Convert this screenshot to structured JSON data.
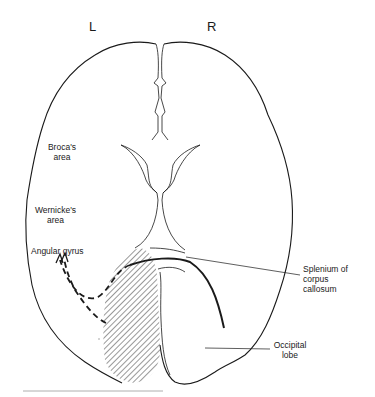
{
  "figure": {
    "type": "anatomical-diagram",
    "hemisphere_labels": {
      "left": "L",
      "right": "R"
    },
    "labels": {
      "broca": {
        "line1": "Broca's",
        "line2": "area"
      },
      "wernicke": {
        "line1": "Wernicke's",
        "line2": "area"
      },
      "angular_gyrus": "Angular gyrus",
      "splenium": {
        "line1": "Splenium of",
        "line2": "corpus",
        "line3": "callosum"
      },
      "occipital": {
        "line1": "Occipital",
        "line2": "lobe"
      }
    },
    "colors": {
      "line": "#1a1a1a",
      "hatch": "#333333",
      "background": "#ffffff",
      "rule": "#999999"
    }
  }
}
